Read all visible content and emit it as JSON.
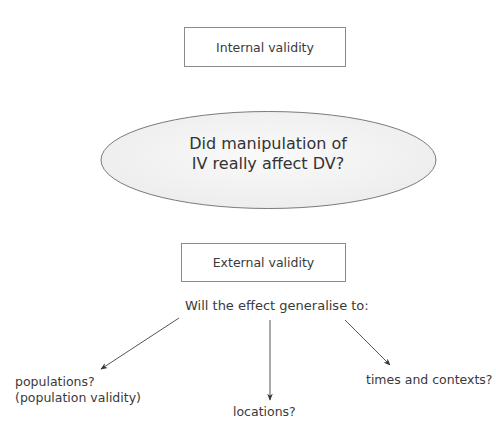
{
  "internal_validity": {
    "label": "Internal validity"
  },
  "central_question": {
    "line1": "Did manipulation of",
    "line2": "IV really affect DV?"
  },
  "external_validity": {
    "label": "External validity"
  },
  "generalise_question": "Will the effect generalise to:",
  "targets": [
    {
      "line1": "populations?",
      "line2": "(population validity)"
    },
    {
      "line1": "locations?"
    },
    {
      "line1": "times and contexts?"
    }
  ],
  "colors": {
    "stroke": "#8a8a8a",
    "ellipse_fill": "#f0f0f0",
    "text": "#3a3a3a",
    "arrow": "#555555"
  }
}
